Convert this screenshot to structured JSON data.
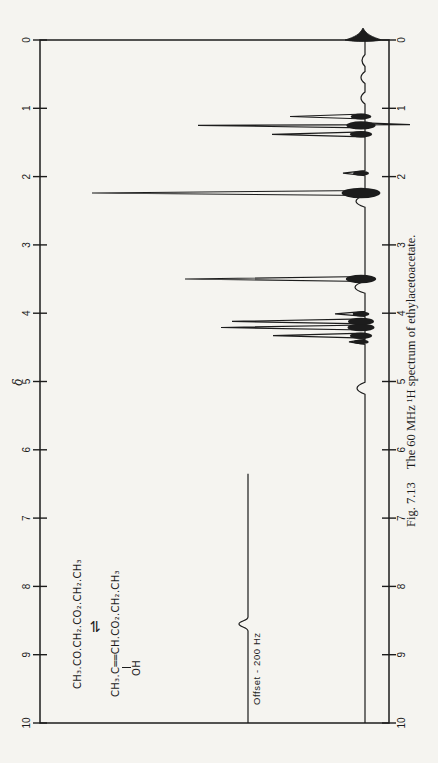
{
  "figure": {
    "caption_label": "Fig. 7.13",
    "caption_text": "The 60 MHz ¹H spectrum of ethylacetoacetate.",
    "delta_symbol": "δ",
    "offset_label": "Offset - 200 Hz"
  },
  "structure": {
    "keto": "CH₃.CO.CH₂.CO₂.CH₂.CH₃",
    "equilibrium_symbol": "⇌",
    "enol_left": "CH₃.C",
    "enol_bond": "══",
    "enol_right": "CH.CO₂.CH₂.CH₃",
    "enol_oh": "OH"
  },
  "chart_data": {
    "type": "line",
    "xlabel": "δ",
    "x_axis": {
      "min": 0,
      "max": 10,
      "reversed": true,
      "ticks": [
        0,
        1,
        2,
        3,
        4,
        5,
        6,
        7,
        8,
        9,
        10
      ],
      "tick_labels": [
        "0",
        "1",
        "2",
        "3",
        "4",
        "5",
        "6",
        "7",
        "8",
        "9",
        "10"
      ]
    },
    "note": "peak height in plot px above baseline; spectrum drawn right-to-left (delta 0 at right)",
    "peaks": [
      {
        "delta": 0.3,
        "height": 3,
        "smooth": true
      },
      {
        "delta": 0.55,
        "height": 4,
        "smooth": true
      },
      {
        "delta": 0.85,
        "height": 4,
        "smooth": true
      },
      {
        "delta": 1.12,
        "height": 75
      },
      {
        "delta": 1.25,
        "height": 167,
        "undershoot": 45
      },
      {
        "delta": 1.38,
        "height": 93
      },
      {
        "delta": 1.95,
        "height": 22
      },
      {
        "delta": 2.36,
        "height": 9,
        "smooth": true
      },
      {
        "delta": 2.24,
        "height": 273
      },
      {
        "delta": 3.62,
        "height": 10,
        "smooth": true
      },
      {
        "delta": 3.5,
        "height": 180
      },
      {
        "delta": 4.01,
        "height": 30
      },
      {
        "delta": 4.12,
        "height": 133
      },
      {
        "delta": 4.21,
        "height": 144
      },
      {
        "delta": 4.33,
        "height": 92
      },
      {
        "delta": 4.42,
        "height": 16
      },
      {
        "delta": 5.1,
        "height": 8,
        "smooth": true
      }
    ],
    "tms_peak": {
      "delta": 0.0,
      "height": 13
    },
    "offset_trace": {
      "label": "Offset - 200 Hz",
      "baseline_lift_px": 117,
      "start_delta": 10.0,
      "end_delta": 6.35,
      "peak_delta": 8.55,
      "peak_height": 9
    },
    "ink_color": "#1c1c1c",
    "paper_color": "#f5f4f0"
  }
}
